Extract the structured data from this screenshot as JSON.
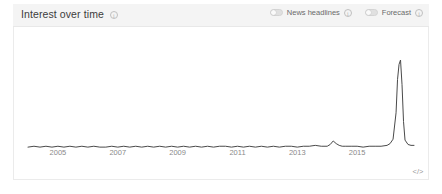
{
  "panel": {
    "title": "Interest over time",
    "info_icon": "info-icon",
    "embed_icon": "</>"
  },
  "controls": [
    {
      "label": "News headlines",
      "state": "off",
      "info_icon": "info-icon"
    },
    {
      "label": "Forecast",
      "state": "off",
      "info_icon": "info-icon"
    }
  ],
  "colors": {
    "line": "#4a4a4a",
    "header_bg": "#f4f4f4",
    "panel_bg": "#ffffff",
    "border": "#ebebeb",
    "label": "#8a8a8a"
  },
  "chart_data": {
    "type": "line",
    "title": "Interest over time",
    "xlabel": "",
    "ylabel": "",
    "grid": false,
    "legend": "none",
    "xlim": [
      2004.0,
      2016.9
    ],
    "ylim": [
      0,
      100
    ],
    "ticks": [
      {
        "label": "2005",
        "x": 2005
      },
      {
        "label": "2007",
        "x": 2007
      },
      {
        "label": "2009",
        "x": 2009
      },
      {
        "label": "2011",
        "x": 2011
      },
      {
        "label": "2013",
        "x": 2013
      },
      {
        "label": "2015",
        "x": 2015
      }
    ],
    "series": [
      {
        "name": "Interest",
        "x": [
          2004.0,
          2004.2,
          2004.4,
          2004.6,
          2004.8,
          2005.0,
          2005.2,
          2005.4,
          2005.6,
          2005.8,
          2006.0,
          2006.2,
          2006.4,
          2006.6,
          2006.8,
          2007.0,
          2007.2,
          2007.4,
          2007.6,
          2007.8,
          2008.0,
          2008.2,
          2008.4,
          2008.6,
          2008.8,
          2009.0,
          2009.2,
          2009.4,
          2009.6,
          2009.8,
          2010.0,
          2010.2,
          2010.4,
          2010.6,
          2010.8,
          2011.0,
          2011.2,
          2011.4,
          2011.6,
          2011.8,
          2012.0,
          2012.2,
          2012.4,
          2012.6,
          2012.8,
          2013.0,
          2013.2,
          2013.4,
          2013.6,
          2013.8,
          2014.0,
          2014.1,
          2014.2,
          2014.3,
          2014.4,
          2014.5,
          2014.6,
          2014.8,
          2015.0,
          2015.2,
          2015.4,
          2015.6,
          2015.8,
          2016.0,
          2016.1,
          2016.2,
          2016.3,
          2016.35,
          2016.4,
          2016.45,
          2016.5,
          2016.55,
          2016.6,
          2016.7,
          2016.8,
          2016.9
        ],
        "values": [
          1,
          2,
          1,
          2,
          1,
          2,
          1,
          2,
          1,
          2,
          1,
          2,
          1,
          1,
          2,
          1,
          2,
          1,
          2,
          1,
          2,
          1,
          2,
          1,
          2,
          1,
          2,
          1,
          2,
          1,
          2,
          1,
          2,
          2,
          1,
          2,
          1,
          2,
          1,
          2,
          1,
          2,
          1,
          2,
          2,
          1,
          2,
          2,
          3,
          2,
          2,
          4,
          8,
          5,
          3,
          2,
          2,
          2,
          2,
          1,
          2,
          2,
          2,
          3,
          5,
          10,
          40,
          78,
          95,
          100,
          72,
          30,
          9,
          4,
          3,
          3
        ]
      }
    ],
    "annotations": [
      {
        "text": "minor bump",
        "x": 2014.2,
        "y": 8
      },
      {
        "text": "major spike",
        "x": 2016.45,
        "y": 100
      }
    ]
  }
}
